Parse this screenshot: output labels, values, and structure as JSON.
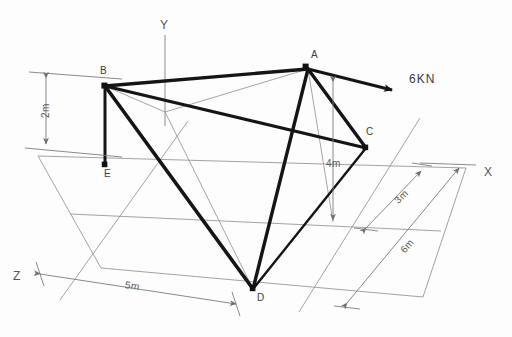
{
  "diagram": {
    "stroke_member": "#151515",
    "stroke_thin": "#8c8c8c",
    "background": "#fdfdfd",
    "nodes": [
      {
        "id": "A",
        "label": "A",
        "x": 308,
        "y": 69,
        "label_x": 311,
        "label_y": 49
      },
      {
        "id": "B",
        "label": "B",
        "x": 105,
        "y": 86,
        "label_x": 100,
        "label_y": 65
      },
      {
        "id": "C",
        "label": "C",
        "x": 366,
        "y": 148,
        "label_x": 366,
        "label_y": 126
      },
      {
        "id": "D",
        "label": "D",
        "x": 253,
        "y": 289,
        "label_x": 257,
        "label_y": 292
      },
      {
        "id": "E",
        "label": "E",
        "x": 105,
        "y": 165,
        "label_x": 104,
        "label_y": 168
      }
    ],
    "members": [
      {
        "name": "member-B-A",
        "from": "B",
        "to": "A"
      },
      {
        "name": "member-A-C",
        "from": "A",
        "to": "C"
      },
      {
        "name": "member-B-C",
        "from": "B",
        "to": "C"
      },
      {
        "name": "member-B-E",
        "from": "B",
        "to": "E"
      },
      {
        "name": "member-B-D",
        "from": "B",
        "to": "D"
      },
      {
        "name": "member-A-D",
        "from": "A",
        "to": "D"
      },
      {
        "name": "member-C-D",
        "from": "C",
        "to": "D"
      }
    ],
    "axes": [
      {
        "name": "axis-y",
        "label": "Y",
        "label_x": 160,
        "label_y": 18
      },
      {
        "name": "axis-x",
        "label": "X",
        "label_x": 484,
        "label_y": 165
      },
      {
        "name": "axis-z",
        "label": "Z",
        "label_x": 13,
        "label_y": 269
      }
    ],
    "force": {
      "name": "applied-load",
      "label": "6KN",
      "label_x": 409,
      "label_y": 72,
      "magnitude": 6,
      "unit": "KN",
      "applied_at": "A",
      "tail_x": 308,
      "tail_y": 69,
      "tip_x": 397,
      "tip_y": 91
    },
    "dimensions": [
      {
        "name": "dim-height-2m",
        "label": "2m",
        "value": 2,
        "unit": "m",
        "label_x": 40,
        "label_y": 118,
        "rot": "rot-2m"
      },
      {
        "name": "dim-height-4m",
        "label": "4m",
        "value": 4,
        "unit": "m",
        "label_x": 326,
        "label_y": 158,
        "rot": ""
      },
      {
        "name": "dim-depth-3m",
        "label": "3m",
        "value": 3,
        "unit": "m",
        "label_x": 392,
        "label_y": 198,
        "rot": "rot-3m"
      },
      {
        "name": "dim-depth-6m",
        "label": "6m",
        "value": 6,
        "unit": "m",
        "label_x": 398,
        "label_y": 248,
        "rot": "rot-6m"
      },
      {
        "name": "dim-width-5m",
        "label": "5m",
        "value": 5,
        "unit": "m",
        "label_x": 126,
        "label_y": 279,
        "rot": "rot-5m"
      }
    ]
  }
}
